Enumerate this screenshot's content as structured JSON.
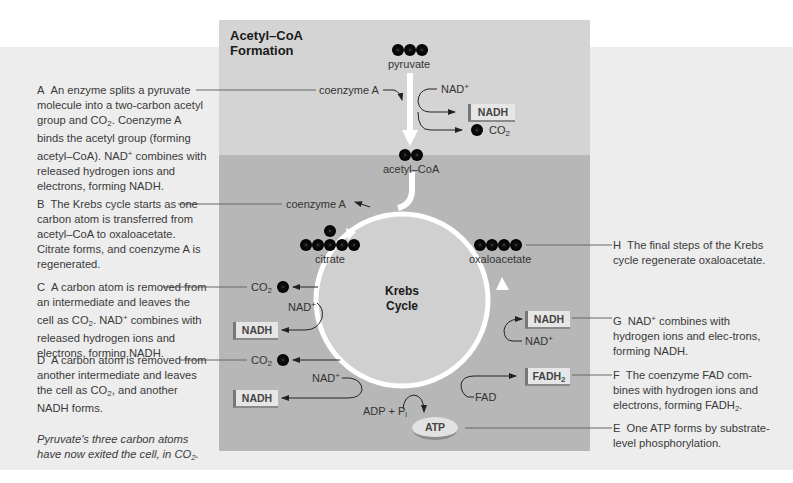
{
  "header": {
    "title_line1": "Acetyl–CoA",
    "title_line2": "Formation"
  },
  "cycle": {
    "title_line1": "Krebs",
    "title_line2": "Cycle"
  },
  "molecules": {
    "pyruvate": "pyruvate",
    "acetyl_coa": "acetyl–CoA",
    "citrate": "citrate",
    "oxaloacetate": "oxaloacetate"
  },
  "labels": {
    "coenzyme_a_top": "coenzyme A",
    "coenzyme_a_cycle": "coenzyme A",
    "nad_top": "NAD",
    "nadh_top": "NADH",
    "co2_top": "CO",
    "co2_c": "CO",
    "nad_c": "NAD",
    "nadh_c": "NADH",
    "co2_d": "CO",
    "nad_d": "NAD",
    "nadh_d": "NADH",
    "adp": "ADP + P",
    "adp_sub": "i",
    "atp": "ATP",
    "fad": "FAD",
    "fadh2": "FADH",
    "nadh_g": "NADH",
    "nad_g": "NAD",
    "plus": "+",
    "two": "2"
  },
  "descriptions": {
    "A": {
      "letter": "A",
      "text1": "An enzyme splits a pyruvate molecule into a two-carbon acetyl group and CO",
      "text2": ". Coenzyme A binds the acetyl group (forming acetyl–CoA). NAD",
      "text3": " combines with released hydrogen ions and electrons, forming NADH."
    },
    "B": {
      "letter": "B",
      "text": "The Krebs cycle starts as one carbon atom is transferred from acetyl–CoA to oxaloacetate. Citrate forms, and coenzyme A is regenerated."
    },
    "C": {
      "letter": "C",
      "text1": "A carbon atom is removed from an intermediate and leaves the cell as CO",
      "text2": ". NAD",
      "text3": " combines with released hydrogen ions and electrons, forming NADH."
    },
    "D": {
      "letter": "D",
      "text1": "A carbon atom is removed from another intermediate and leaves the cell as CO",
      "text2": ", and another NADH forms."
    },
    "note": {
      "text1": "Pyruvate's three carbon atoms have now exited the cell, in CO",
      "text2": "."
    },
    "H": {
      "letter": "H",
      "text": "The final steps of the Krebs cycle regenerate oxaloacetate."
    },
    "G": {
      "letter": "G",
      "text1": "NAD",
      "text2": " combines with hydrogen ions and elec-trons, forming NADH."
    },
    "F": {
      "letter": "F",
      "text1": "The coenzyme FAD com-bines with hydrogen ions and electrons, forming FADH",
      "text2": "."
    },
    "E": {
      "letter": "E",
      "text": "One ATP forms by substrate-level phosphorylation."
    }
  },
  "colors": {
    "page": "#ffffff",
    "band": "#ededed",
    "panel_top": "#d4d4d4",
    "panel_bottom": "#b7b7b7",
    "cycle_fill": "#d0d0d0",
    "arrow": "#ffffff",
    "atom": "#111111"
  }
}
